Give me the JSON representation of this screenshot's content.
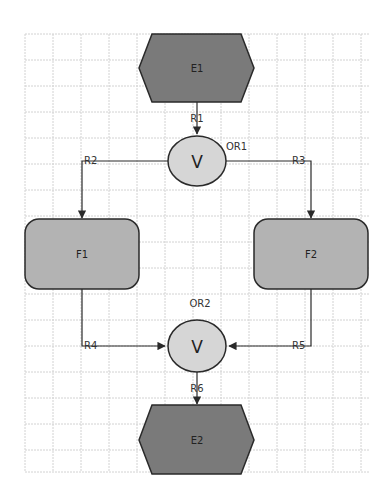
{
  "colors": {
    "event_fill": "#7a7a7a",
    "function_fill": "#b3b3b3",
    "connector_fill": "#d6d6d6",
    "stroke": "#2a2a2a",
    "grid": "#cfcfcf"
  },
  "nodes": {
    "e1": {
      "label": "E1",
      "type": "event"
    },
    "e2": {
      "label": "E2",
      "type": "event"
    },
    "f1": {
      "label": "F1",
      "type": "function"
    },
    "f2": {
      "label": "F2",
      "type": "function"
    },
    "or1": {
      "label": "OR1",
      "symbol": "V",
      "type": "xor-connector"
    },
    "or2": {
      "label": "OR2",
      "symbol": "V",
      "type": "xor-connector"
    }
  },
  "edges": {
    "r1": {
      "label": "R1",
      "from": "E1",
      "to": "OR1"
    },
    "r2": {
      "label": "R2",
      "from": "OR1",
      "to": "F1"
    },
    "r3": {
      "label": "R3",
      "from": "OR1",
      "to": "F2"
    },
    "r4": {
      "label": "R4",
      "from": "F1",
      "to": "OR2"
    },
    "r5": {
      "label": "R5",
      "from": "F2",
      "to": "OR2"
    },
    "r6": {
      "label": "R6",
      "from": "OR2",
      "to": "E2"
    }
  }
}
